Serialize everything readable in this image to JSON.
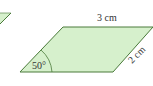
{
  "diagram": {
    "shape": "parallelogram",
    "fill_color": "#d6f0cc",
    "stroke_color": "#4a7a3a",
    "labels": {
      "top_side": "3 cm",
      "right_side": "2 cm",
      "angle": "50°"
    },
    "partial_shape_left": "partial parallelogram (cropped)"
  }
}
